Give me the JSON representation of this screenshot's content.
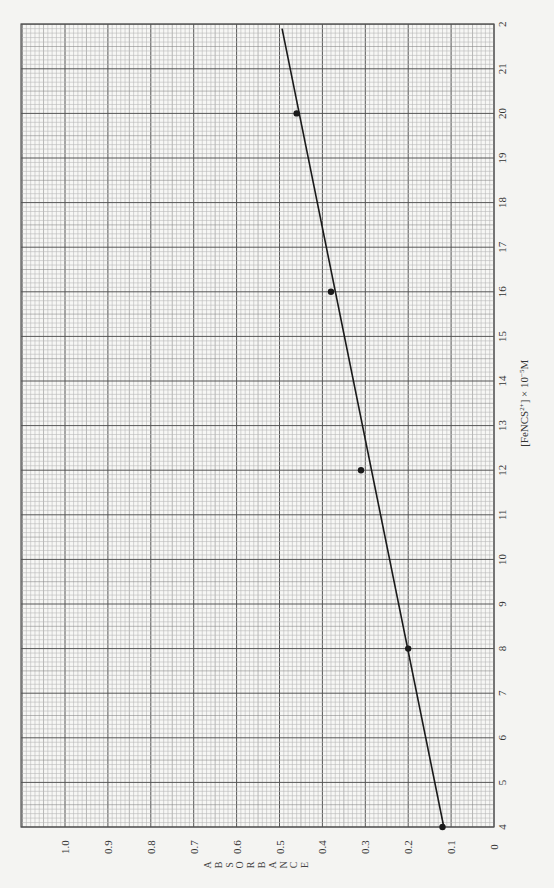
{
  "chart_data": {
    "type": "scatter",
    "title": "",
    "orientation": "rotated 90deg (concentration axis runs bottom-to-top along right edge, absorbance axis runs right-to-left along bottom edge)",
    "xlabel": "[FeNCS2+] × 10^-5 M",
    "xlabel_display": {
      "prefix": "[FeNCS",
      "sup1": "2+",
      "mid": "] × 10",
      "sup2": "−5",
      "suffix": "M"
    },
    "ylabel": "ABSORBANCE",
    "ylabel_letters": [
      "A",
      "B",
      "S",
      "O",
      "R",
      "B",
      "A",
      "N",
      "C",
      "E"
    ],
    "xlim": [
      4,
      22
    ],
    "ylim": [
      0,
      1.1
    ],
    "x_ticks": [
      "4",
      "5",
      "6",
      "7",
      "8",
      "9",
      "10",
      "11",
      "12",
      "13",
      "14",
      "15",
      "16",
      "17",
      "18",
      "19",
      "20",
      "21",
      "2"
    ],
    "y_ticks": [
      "0",
      "0.1",
      "0.2",
      "0.3",
      "0.4",
      "0.5",
      "0.6",
      "0.7",
      "0.8",
      "0.9",
      "1.0"
    ],
    "grid": true,
    "series": [
      {
        "name": "Measured points",
        "type": "scatter",
        "x": [
          4,
          8,
          12,
          16,
          20
        ],
        "y": [
          0.12,
          0.2,
          0.31,
          0.38,
          0.46
        ]
      },
      {
        "name": "Best-fit line",
        "type": "line",
        "x": [
          4,
          21.9
        ],
        "y": [
          0.117,
          0.494
        ]
      }
    ]
  },
  "colors": {
    "paper": "#f4f4f2",
    "minor_grid": "#b8b8b8",
    "mid_grid": "#8a8a8a",
    "major_grid": "#555555",
    "data": "#1a1a1a"
  }
}
